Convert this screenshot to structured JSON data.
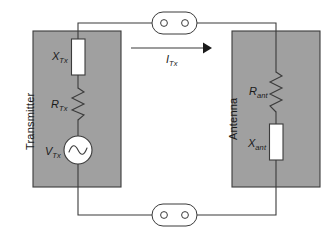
{
  "figure": {
    "type": "circuit-schematic",
    "background_color": "#ffffff",
    "line_color": "#3b3b3b",
    "block_fill_color": "#a0a0a0",
    "block_stroke_color": "#3b3b3b",
    "component_fill_color": "#ffffff"
  },
  "blocks": [
    {
      "id": "transmitter",
      "label": "Transmitter",
      "x": 33,
      "y": 31,
      "width": 88,
      "height": 156,
      "label_x": 24,
      "label_y": 150
    },
    {
      "id": "antenna",
      "label": "Antenna",
      "x": 232,
      "y": 31,
      "width": 88,
      "height": 156,
      "label_x": 227,
      "label_y": 140
    }
  ],
  "components": [
    {
      "id": "x-tx",
      "kind": "reactance-box",
      "symbol": "X",
      "subscript": "Tx",
      "label_x": 52,
      "label_y": 51
    },
    {
      "id": "r-tx",
      "kind": "resistor-zigzag",
      "symbol": "R",
      "subscript": "Tx",
      "label_x": 51,
      "label_y": 99
    },
    {
      "id": "v-tx",
      "kind": "ac-voltage-source",
      "symbol": "V",
      "subscript": "Tx",
      "label_x": 45,
      "label_y": 146
    },
    {
      "id": "r-ant",
      "kind": "resistor-zigzag",
      "symbol": "R",
      "subscript": "ant",
      "label_x": 249,
      "label_y": 86
    },
    {
      "id": "x-ant",
      "kind": "reactance-box",
      "symbol": "X",
      "subscript": "ant",
      "label_x": 248,
      "label_y": 138
    }
  ],
  "current_arrow": {
    "id": "i-tx",
    "symbol": "I",
    "subscript": "Tx",
    "direction": "right",
    "label_x": 166,
    "label_y": 54,
    "x_start": 131,
    "x_end": 211,
    "y": 48
  },
  "connectors": [
    {
      "id": "connector-top",
      "cx": 174,
      "cy": 23
    },
    {
      "id": "connector-bottom",
      "cx": 174,
      "cy": 215
    }
  ]
}
